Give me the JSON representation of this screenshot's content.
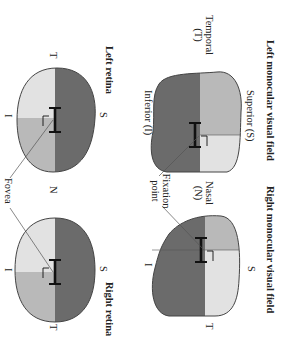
{
  "titles": {
    "left_field": "Left monocular visual field",
    "right_field": "Right monocular visual field",
    "left_retina": "Left retina",
    "right_retina": "Right retina"
  },
  "left_field_labels": {
    "superior": "Superior (S)",
    "temporal_line1": "Temporal",
    "temporal_line2": "(T)",
    "inferior": "Inferior (I)"
  },
  "right_field_labels": {
    "nasal_line1": "Nasal",
    "nasal_line2": "(N)",
    "superior": "S",
    "inferior": "I",
    "temporal": "T",
    "fixation_line1": "Fixation",
    "fixation_line2": "point"
  },
  "left_retina_labels": {
    "temporal": "T",
    "superior": "S",
    "inferior": "I"
  },
  "middle_labels": {
    "nasal": "N",
    "fovea": "Fovea"
  },
  "right_retina_labels": {
    "superior": "S",
    "inferior": "I",
    "temporal": "T"
  },
  "colors": {
    "dark": "#6b6b6b",
    "medium": "#b9b9b9",
    "light": "#e2e2e2",
    "outline": "#444444"
  },
  "orientation": "rotated 90 degrees clockwise"
}
